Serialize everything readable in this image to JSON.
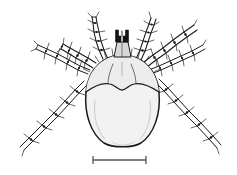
{
  "figure": {
    "caption": "",
    "background_color": "#ffffff",
    "ink_color": "#1a1a1a",
    "body_fill_color": "#f2f2f2",
    "scutum_fill_color": "#ececec",
    "capitulum_fill_color": "#d8d8d8"
  },
  "specimen": {
    "common_name": "tick",
    "view": "dorsal",
    "parts": [
      {
        "id": "idiosoma",
        "label": "idiosoma",
        "note": "oval body"
      },
      {
        "id": "scutum",
        "label": "scutum",
        "note": "dorsal shield across anterior body"
      },
      {
        "id": "capitulum",
        "label": "capitulum",
        "note": "mouthparts at anterior margin"
      },
      {
        "id": "palps",
        "label": "palps",
        "note": "dark paired mouthpart appendages"
      }
    ],
    "leg_count": 8,
    "legs": [
      {
        "id": "leg-L1",
        "label": "left leg I",
        "side": "left",
        "position": 1
      },
      {
        "id": "leg-L2",
        "label": "left leg II",
        "side": "left",
        "position": 2
      },
      {
        "id": "leg-L3",
        "label": "left leg III",
        "side": "left",
        "position": 3
      },
      {
        "id": "leg-L4",
        "label": "left leg IV",
        "side": "left",
        "position": 4
      },
      {
        "id": "leg-R1",
        "label": "right leg I",
        "side": "right",
        "position": 1
      },
      {
        "id": "leg-R2",
        "label": "right leg II",
        "side": "right",
        "position": 2
      },
      {
        "id": "leg-R3",
        "label": "right leg III",
        "side": "right",
        "position": 3
      },
      {
        "id": "leg-R4",
        "label": "right leg IV",
        "side": "right",
        "position": 4
      }
    ]
  },
  "scale_bar": {
    "label": "",
    "has_end_ticks": true,
    "color": "#555555"
  }
}
